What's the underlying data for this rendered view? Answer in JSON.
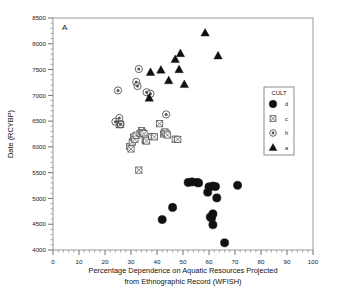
{
  "panel": {
    "label": "A"
  },
  "axes": {
    "x": {
      "title_line1": "Percentage Dependence on Aquatic Resources Projected",
      "title_line2": "from Ethnographic Record (WFISH)",
      "ticks": [
        0,
        10,
        20,
        30,
        40,
        50,
        60,
        70,
        80,
        90,
        100
      ],
      "min": 0,
      "max": 100,
      "minor_step": 2
    },
    "y": {
      "title": "Date (RCYBP)",
      "ticks": [
        4000,
        4500,
        5000,
        5500,
        6000,
        6500,
        7000,
        7500,
        8000,
        8500
      ],
      "min": 4000,
      "max": 8500,
      "minor_step": 100
    }
  },
  "legend": {
    "title": "CULT",
    "entries": [
      {
        "label": "d",
        "marker": "filled-circle-marker"
      },
      {
        "label": "c",
        "marker": "crossed-square-marker"
      },
      {
        "label": "h",
        "marker": "circled-dot-marker"
      },
      {
        "label": "a",
        "marker": "filled-triangle-marker"
      }
    ]
  },
  "colors": {
    "marker_dark": "#111111",
    "marker_outline": "#555555",
    "frame": "#9a9a9a",
    "background": "#ffffff"
  },
  "chart_data": {
    "type": "scatter",
    "title": "",
    "xlabel": "Percentage Dependence on Aquatic Resources Projected from Ethnographic Record (WFISH)",
    "ylabel": "Date (RCYBP)",
    "xlim": [
      0,
      100
    ],
    "ylim": [
      4000,
      8500
    ],
    "grid": false,
    "legend_position": "right",
    "legend_title": "CULT",
    "series": [
      {
        "name": "d",
        "marker": "filled-circle",
        "points": [
          [
            42.0,
            4590
          ],
          [
            46.0,
            4825
          ],
          [
            52.0,
            5310
          ],
          [
            53.5,
            5320
          ],
          [
            55.5,
            5310
          ],
          [
            56.0,
            5300
          ],
          [
            59.5,
            5120
          ],
          [
            60.0,
            5225
          ],
          [
            60.5,
            4640
          ],
          [
            61.0,
            4620
          ],
          [
            61.5,
            5240
          ],
          [
            61.5,
            4700
          ],
          [
            61.5,
            4490
          ],
          [
            62.5,
            5230
          ],
          [
            63.0,
            5010
          ],
          [
            66.0,
            4140
          ],
          [
            71.0,
            5255
          ]
        ]
      },
      {
        "name": "c",
        "marker": "crossed-square",
        "points": [
          [
            25.5,
            6430
          ],
          [
            26.0,
            6440
          ],
          [
            29.5,
            6010
          ],
          [
            30.0,
            5960
          ],
          [
            30.5,
            6095
          ],
          [
            31.0,
            6190
          ],
          [
            31.5,
            6145
          ],
          [
            32.0,
            6225
          ],
          [
            33.0,
            5550
          ],
          [
            33.5,
            6260
          ],
          [
            34.0,
            6315
          ],
          [
            34.5,
            6280
          ],
          [
            35.0,
            6255
          ],
          [
            35.5,
            6120
          ],
          [
            35.5,
            6150
          ],
          [
            36.0,
            6115
          ],
          [
            38.0,
            6200
          ],
          [
            39.0,
            6195
          ],
          [
            41.0,
            6450
          ],
          [
            42.5,
            6250
          ],
          [
            43.0,
            6290
          ],
          [
            43.5,
            6265
          ],
          [
            44.0,
            6230
          ],
          [
            47.0,
            6150
          ],
          [
            48.0,
            6145
          ]
        ]
      },
      {
        "name": "h",
        "marker": "circled-dot",
        "points": [
          [
            24.0,
            6490
          ],
          [
            25.0,
            7095
          ],
          [
            25.5,
            6560
          ],
          [
            26.0,
            6440
          ],
          [
            32.0,
            7260
          ],
          [
            32.5,
            7180
          ],
          [
            33.0,
            7510
          ],
          [
            36.0,
            7060
          ],
          [
            37.5,
            7030
          ],
          [
            43.5,
            6630
          ]
        ]
      },
      {
        "name": "a",
        "marker": "filled-triangle",
        "points": [
          [
            37.0,
            6950
          ],
          [
            37.5,
            7450
          ],
          [
            41.5,
            7495
          ],
          [
            44.5,
            7290
          ],
          [
            47.0,
            7700
          ],
          [
            48.5,
            7505
          ],
          [
            49.0,
            7815
          ],
          [
            50.5,
            7215
          ],
          [
            58.5,
            8215
          ],
          [
            63.5,
            7770
          ]
        ]
      }
    ]
  }
}
